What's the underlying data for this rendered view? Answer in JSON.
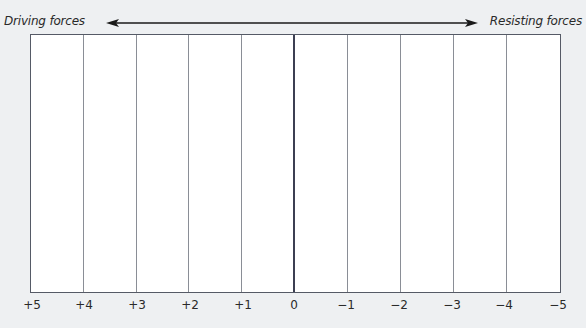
{
  "diagram": {
    "left_label": "Driving forces",
    "right_label": "Resisting forces",
    "arrow": "double-headed horizontal arrow",
    "scale": [
      "+5",
      "+4",
      "+3",
      "+2",
      "+1",
      "0",
      "−1",
      "−2",
      "−3",
      "−4",
      "−5"
    ],
    "columns": 10,
    "center_value": "0"
  },
  "colors": {
    "background": "#eef0f2",
    "grid_fill": "#ffffff",
    "grid_lines": "#8a8e96",
    "center_line": "#3c3f52",
    "text": "#2a2a2a"
  }
}
